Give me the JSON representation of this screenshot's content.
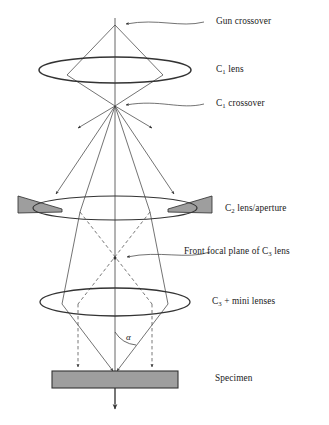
{
  "figure": {
    "background_color": "#ffffff",
    "line_color": "#333333",
    "fill_gray": "#9e9e9e",
    "axis_color": "#4a4a4a"
  },
  "labels": {
    "gun_crossover": "Gun crossover",
    "c1_lens_prefix": "C",
    "c1_lens_sub": "1",
    "c1_lens_suffix": " lens",
    "c1_crossover_prefix": "C",
    "c1_crossover_sub": "1",
    "c1_crossover_suffix": " crossover",
    "c2_lens_prefix": "C",
    "c2_lens_sub": "2",
    "c2_lens_suffix": " lens/aperture",
    "front_focal_prefix": "Front focal plane of C",
    "front_focal_sub": "3",
    "front_focal_suffix": " lens",
    "c3_lens_prefix": "C",
    "c3_lens_sub": "3",
    "c3_lens_suffix": " + mini lenses",
    "specimen": "Specimen",
    "alpha_angle": "α"
  },
  "components": [
    {
      "name": "gun-crossover-point",
      "x": 115,
      "y": 25
    },
    {
      "name": "c1-lens-ellipse",
      "cx": 115,
      "cy": 70,
      "rx": 76,
      "ry": 13
    },
    {
      "name": "c1-crossover-point",
      "x": 115,
      "y": 106
    },
    {
      "name": "c2-lens-ellipse",
      "cx": 115,
      "cy": 208,
      "rx": 82,
      "ry": 12
    },
    {
      "name": "front-focal-plane-point",
      "x": 115,
      "y": 258
    },
    {
      "name": "c3-lens-ellipse",
      "cx": 115,
      "cy": 302,
      "rx": 75,
      "ry": 14
    },
    {
      "name": "specimen-bar",
      "x": 52,
      "y": 371,
      "width": 126,
      "height": 17
    },
    {
      "name": "optic-axis",
      "x": 115,
      "y1": 18,
      "y2": 410
    }
  ],
  "aperture": {
    "left_wedge": {
      "x_outer": 18,
      "x_tip": 62,
      "y_top": 196,
      "y_bottom": 213
    },
    "right_wedge": {
      "x_outer": 212,
      "x_tip": 168,
      "y_top": 196,
      "y_bottom": 213
    }
  }
}
